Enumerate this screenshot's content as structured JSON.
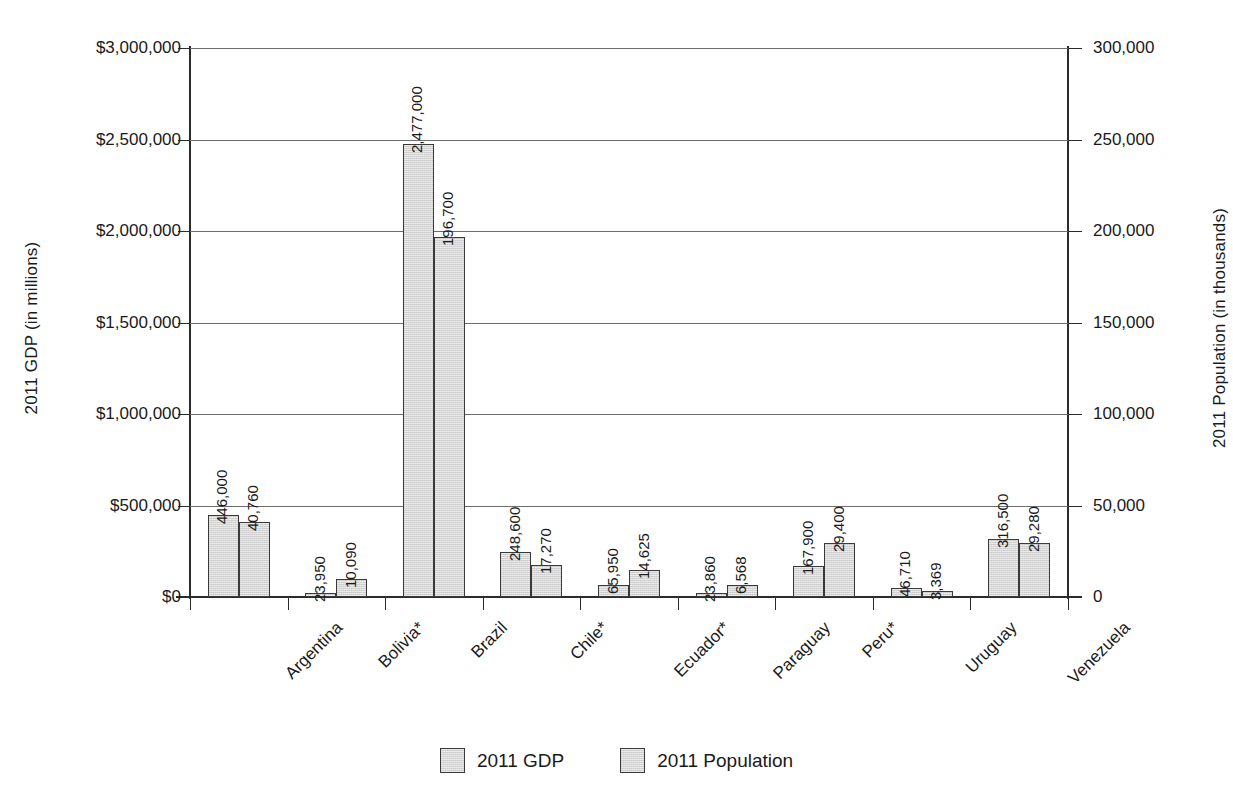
{
  "chart_data": {
    "type": "bar",
    "title": "",
    "subtitle": "",
    "xlabel": "",
    "ylabel": "2011 GDP (in millions)",
    "y2label": "2011 Population (in thousands)",
    "grid": true,
    "legend_position": "bottom",
    "categories": [
      "Argentina",
      "Bolivia*",
      "Brazil",
      "Chile*",
      "Ecuador*",
      "Paraguay",
      "Peru*",
      "Uruguay",
      "Venezuela"
    ],
    "ylim": [
      0,
      3000000
    ],
    "y2lim": [
      0,
      300000
    ],
    "yticks": [
      0,
      500000,
      1000000,
      1500000,
      2000000,
      2500000,
      3000000
    ],
    "ytick_labels": [
      "$0",
      "$500,000",
      "$1,000,000",
      "$1,500,000",
      "$2,000,000",
      "$2,500,000",
      "$3,000,000"
    ],
    "y2ticks": [
      0,
      50000,
      100000,
      150000,
      200000,
      250000,
      300000
    ],
    "y2tick_labels": [
      "0",
      "50,000",
      "100,000",
      "150,000",
      "200,000",
      "250,000",
      "300,000"
    ],
    "series": [
      {
        "name": "2011 GDP",
        "axis": "left",
        "values": [
          446000,
          23950,
          2477000,
          248600,
          65950,
          23860,
          167900,
          46710,
          316500
        ],
        "data_labels": [
          "446,000",
          "23,950",
          "2,477,000",
          "248,600",
          "65,950",
          "23,860",
          "167,900",
          "46,710",
          "316,500"
        ],
        "color": "#d5d5d5",
        "border_color": "#3a3a3a"
      },
      {
        "name": "2011 Population",
        "axis": "right",
        "values": [
          40760,
          10090,
          196700,
          17270,
          14625,
          6568,
          29400,
          3369,
          29280
        ],
        "data_labels": [
          "40,760",
          "10,090",
          "196,700",
          "17,270",
          "14,625",
          "6,568",
          "29,400",
          "3,369",
          "29,280"
        ],
        "color": "#d5d5d5",
        "border_color": "#3a3a3a"
      }
    ],
    "legend": [
      "2011 GDP",
      "2011 Population"
    ]
  }
}
